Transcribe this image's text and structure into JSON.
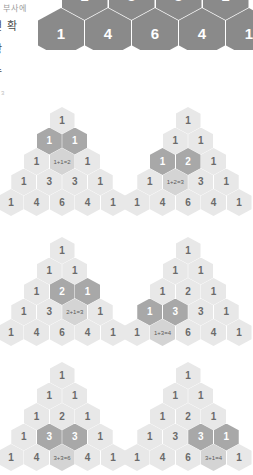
{
  "page": {
    "background": "#ffffff",
    "width": 253,
    "height": 465
  },
  "colors": {
    "cell": "#e8e8e8",
    "cell_text": "#6b6b6b",
    "formula_cell": "#d4d4d4",
    "formula_text": "#5a5a5a",
    "highlight_cell": "#a8a8a8",
    "highlight_text": "#ffffff",
    "top_triangle_cell": "#8a8a8a",
    "top_triangle_text": "#ffffff",
    "side_text": "#4a4a4a"
  },
  "side_text": {
    "lines": [
      "구 부사에",
      "면 확",
      "항",
      "수"
    ],
    "corner_mark": "3"
  },
  "top_triangle": {
    "label": "clipped-pascal-triangle",
    "rows": [
      [
        "1",
        "3",
        "3",
        "1"
      ],
      [
        "1",
        "4",
        "6",
        "4",
        "1"
      ]
    ]
  },
  "panels": [
    {
      "id": "panel-1",
      "formula": "1+1=2",
      "rows": [
        [
          "1"
        ],
        [
          "1",
          "1"
        ],
        [
          "1",
          "1+1=2",
          "1"
        ],
        [
          "1",
          "3",
          "3",
          "1"
        ],
        [
          "1",
          "4",
          "6",
          "4",
          "1"
        ]
      ],
      "highlights": [
        [
          1,
          0
        ],
        [
          1,
          1
        ]
      ],
      "formula_cell": [
        2,
        1
      ]
    },
    {
      "id": "panel-2",
      "formula": "1+2=3",
      "rows": [
        [
          "1"
        ],
        [
          "1",
          "1"
        ],
        [
          "1",
          "2",
          "1"
        ],
        [
          "1",
          "1+2=3",
          "3",
          "1"
        ],
        [
          "1",
          "4",
          "6",
          "4",
          "1"
        ]
      ],
      "highlights": [
        [
          2,
          0
        ],
        [
          2,
          1
        ]
      ],
      "formula_cell": [
        3,
        1
      ]
    },
    {
      "id": "panel-3",
      "formula": "2+1=3",
      "rows": [
        [
          "1"
        ],
        [
          "1",
          "1"
        ],
        [
          "1",
          "2",
          "1"
        ],
        [
          "1",
          "3",
          "2+1=3",
          "1"
        ],
        [
          "1",
          "4",
          "6",
          "4",
          "1"
        ]
      ],
      "highlights": [
        [
          2,
          1
        ],
        [
          2,
          2
        ]
      ],
      "formula_cell": [
        3,
        2
      ]
    },
    {
      "id": "panel-4",
      "formula": "1+3=4",
      "rows": [
        [
          "1"
        ],
        [
          "1",
          "1"
        ],
        [
          "1",
          "2",
          "1"
        ],
        [
          "1",
          "3",
          "3",
          "1"
        ],
        [
          "1",
          "1+3=4",
          "6",
          "4",
          "1"
        ]
      ],
      "highlights": [
        [
          3,
          0
        ],
        [
          3,
          1
        ]
      ],
      "formula_cell": [
        4,
        1
      ]
    },
    {
      "id": "panel-5",
      "formula": "3+3=6",
      "rows": [
        [
          "1"
        ],
        [
          "1",
          "1"
        ],
        [
          "1",
          "2",
          "1"
        ],
        [
          "1",
          "3",
          "3",
          "1"
        ],
        [
          "1",
          "4",
          "3+3=6",
          "4",
          "1"
        ]
      ],
      "highlights": [
        [
          3,
          1
        ],
        [
          3,
          2
        ]
      ],
      "formula_cell": [
        4,
        2
      ]
    },
    {
      "id": "panel-6",
      "formula": "3+1=4",
      "rows": [
        [
          "1"
        ],
        [
          "1",
          "1"
        ],
        [
          "1",
          "2",
          "1"
        ],
        [
          "1",
          "3",
          "3",
          "1"
        ],
        [
          "1",
          "4",
          "6",
          "3+1=4",
          "1"
        ]
      ],
      "highlights": [
        [
          3,
          2
        ],
        [
          3,
          3
        ]
      ],
      "formula_cell": [
        4,
        3
      ]
    }
  ]
}
